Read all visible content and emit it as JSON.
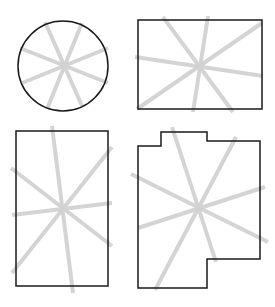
{
  "diagram": {
    "colors": {
      "outline": "#1a1a1a",
      "lines": "#d2d2d2",
      "background": "#ffffff"
    },
    "shapes": [
      {
        "id": "circle",
        "type": "circle",
        "cx": 63,
        "cy": 66,
        "r": 45,
        "lines": [
          [
            45,
            22,
            82,
            106
          ],
          [
            82,
            23,
            47,
            109
          ],
          [
            20,
            48,
            108,
            83
          ],
          [
            108,
            48,
            22,
            83
          ]
        ]
      },
      {
        "id": "wide-rectangle",
        "type": "rect",
        "x": 138,
        "y": 20,
        "w": 124,
        "h": 89,
        "lines": [
          [
            163,
            17,
            233,
            112
          ],
          [
            208,
            16,
            193,
            112
          ],
          [
            135,
            57,
            263,
            76
          ],
          [
            262,
            23,
            137,
            109
          ]
        ]
      },
      {
        "id": "tall-rectangle",
        "type": "rect",
        "x": 16,
        "y": 131,
        "w": 92,
        "h": 155,
        "lines": [
          [
            52,
            126,
            73,
            293
          ],
          [
            112,
            147,
            12,
            273
          ],
          [
            11,
            168,
            112,
            246
          ],
          [
            12,
            215,
            112,
            203
          ]
        ]
      },
      {
        "id": "stepped-polygon",
        "type": "polygon",
        "points": "138,146 161,146 161,132 207,132 207,141 260,141 260,259 207,259 207,288 138,288",
        "lines": [
          [
            172,
            127,
            216,
            262
          ],
          [
            236,
            137,
            155,
            290
          ],
          [
            131,
            174,
            268,
            242
          ],
          [
            265,
            187,
            138,
            228
          ]
        ]
      }
    ]
  }
}
